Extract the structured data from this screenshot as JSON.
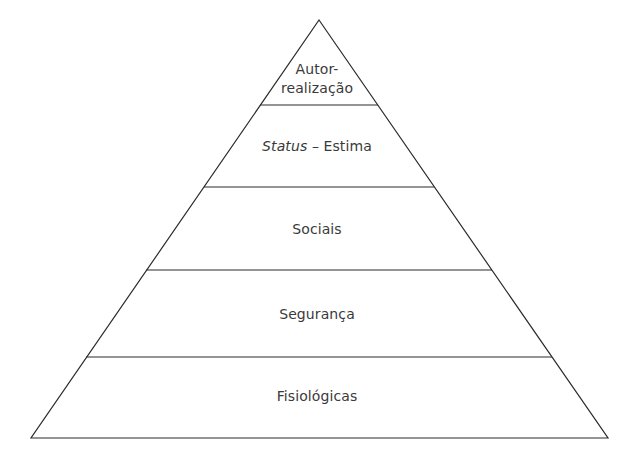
{
  "diagram": {
    "type": "pyramid",
    "title": "",
    "stroke_color": "#2b2b2b",
    "text_color": "#3a3a3a",
    "background": "#ffffff",
    "geometry": {
      "apex": [
        319,
        20
      ],
      "base_y": 438,
      "base_left_x": 31,
      "base_right_x": 608,
      "divider_ys": [
        105,
        187,
        270,
        357
      ]
    },
    "tiers": [
      {
        "level": 5,
        "label_line1": "Autor-",
        "label_line2": "realização"
      },
      {
        "level": 4,
        "label_em": "Status",
        "label_rest": " – Estima"
      },
      {
        "level": 3,
        "label": "Sociais"
      },
      {
        "level": 2,
        "label": "Segurança"
      },
      {
        "level": 1,
        "label": "Fisiológicas"
      }
    ]
  }
}
